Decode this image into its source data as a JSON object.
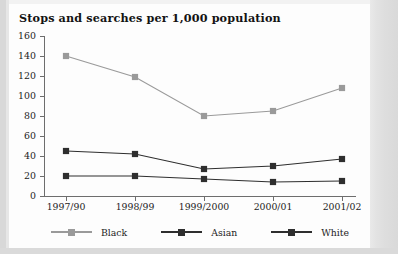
{
  "chart_data": {
    "type": "line",
    "title": "Stops and searches per 1,000 population",
    "xlabel": "",
    "ylabel": "",
    "categories": [
      "1997/90",
      "1998/99",
      "1999/2000",
      "2000/01",
      "2001/02"
    ],
    "series": [
      {
        "name": "Black",
        "values": [
          140,
          119,
          80,
          85,
          108
        ],
        "color": "#9a9a9a",
        "marker": "square"
      },
      {
        "name": "Asian",
        "values": [
          45,
          42,
          27,
          30,
          37
        ],
        "color": "#2e2e2e",
        "marker": "square"
      },
      {
        "name": "White",
        "values": [
          20,
          20,
          17,
          14,
          15
        ],
        "color": "#2e2e2e",
        "marker": "square"
      }
    ],
    "ylim": [
      0,
      160
    ],
    "yticks": [
      0,
      20,
      40,
      60,
      80,
      100,
      120,
      140,
      160
    ],
    "ytick_labels": [
      "0",
      "20",
      "40",
      "60",
      "80",
      "100",
      "120",
      "140",
      "160"
    ],
    "grid": false,
    "legend_position": "bottom"
  },
  "legend": {
    "items": [
      {
        "label": "Black",
        "color": "#9a9a9a"
      },
      {
        "label": "Asian",
        "color": "#2e2e2e"
      },
      {
        "label": "White",
        "color": "#2e2e2e"
      }
    ]
  }
}
